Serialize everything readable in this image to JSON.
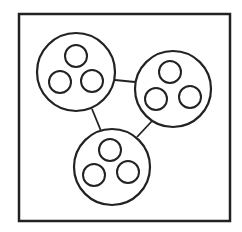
{
  "diagram": {
    "stroke_color": "#222222",
    "background_color": "#ffffff",
    "frame": {
      "x": 19,
      "y": 14,
      "width": 211,
      "height": 207,
      "stroke_width": 2.5
    },
    "clusters": [
      {
        "id": "cluster-top-left",
        "cx": 76,
        "cy": 72,
        "r": 39,
        "members": [
          {
            "cx": 76,
            "cy": 56,
            "r": 11
          },
          {
            "cx": 60,
            "cy": 82,
            "r": 11
          },
          {
            "cx": 92,
            "cy": 81,
            "r": 11
          }
        ]
      },
      {
        "id": "cluster-right",
        "cx": 173,
        "cy": 89,
        "r": 38,
        "members": [
          {
            "cx": 170,
            "cy": 72,
            "r": 11
          },
          {
            "cx": 156,
            "cy": 99,
            "r": 11
          },
          {
            "cx": 190,
            "cy": 97,
            "r": 11
          }
        ]
      },
      {
        "id": "cluster-bottom",
        "cx": 112,
        "cy": 167,
        "r": 38,
        "members": [
          {
            "cx": 110,
            "cy": 150,
            "r": 11
          },
          {
            "cx": 94,
            "cy": 175,
            "r": 11
          },
          {
            "cx": 128,
            "cy": 172,
            "r": 11
          }
        ]
      }
    ],
    "edges": [
      {
        "from": "cluster-top-left",
        "to": "cluster-right",
        "x1": 115,
        "y1": 80,
        "x2": 135,
        "y2": 82
      },
      {
        "from": "cluster-top-left",
        "to": "cluster-bottom",
        "x1": 92,
        "y1": 109,
        "x2": 101,
        "y2": 131
      },
      {
        "from": "cluster-right",
        "to": "cluster-bottom",
        "x1": 152,
        "y1": 121,
        "x2": 137,
        "y2": 137
      }
    ]
  }
}
